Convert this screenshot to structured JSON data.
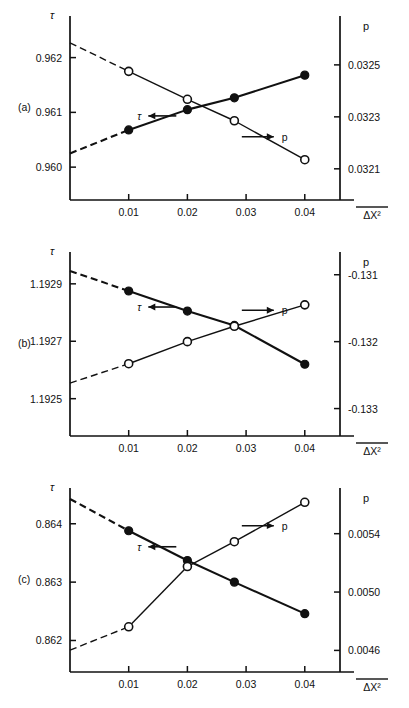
{
  "figure": {
    "xlabel": "ΔX²",
    "xlabel_overbar": true,
    "x_ticks": [
      "0.01",
      "0.02",
      "0.03",
      "0.04"
    ],
    "left_axis_title": "τ",
    "right_axis_title": "p",
    "tau_annotation": "τ",
    "p_annotation": "p",
    "tau_marker": "filled-circle",
    "p_marker": "open-circle"
  },
  "chart_data": [
    {
      "type": "line",
      "panel": "(a)",
      "title": "",
      "xlabel": "ΔX²",
      "x": [
        0.01,
        0.02,
        0.028,
        0.04
      ],
      "xlim": [
        0.0,
        0.046
      ],
      "xticks": [
        0.01,
        0.02,
        0.03,
        0.04
      ],
      "left_ylabel": "τ",
      "left_yticks": [
        0.96,
        0.961,
        0.962
      ],
      "left_yticklabels": [
        "0.960",
        "0.961",
        "0.962"
      ],
      "left_ylim": [
        0.9594,
        0.96265
      ],
      "right_ylabel": "p",
      "right_yticks": [
        0.0321,
        0.0323,
        0.0325
      ],
      "right_yticklabels": [
        "0.0321",
        "0.0323",
        "0.0325"
      ],
      "right_ylim": [
        0.03198,
        0.032665
      ],
      "series": [
        {
          "name": "τ",
          "axis": "left",
          "marker": "filled-circle",
          "values": [
            0.96068,
            0.96105,
            0.961265,
            0.96168
          ],
          "intercept_at_zero": 0.96025,
          "dashed_extrapolation": true
        },
        {
          "name": "p",
          "axis": "right",
          "marker": "open-circle",
          "values": [
            0.032475,
            0.0323675,
            0.032285,
            0.032135
          ],
          "intercept_at_zero": 0.032585,
          "dashed_extrapolation": true
        }
      ]
    },
    {
      "type": "line",
      "panel": "(b)",
      "title": "",
      "xlabel": "ΔX²",
      "x": [
        0.01,
        0.02,
        0.028,
        0.04
      ],
      "xlim": [
        0.0,
        0.046
      ],
      "xticks": [
        0.01,
        0.02,
        0.03,
        0.04
      ],
      "left_ylabel": "τ",
      "left_yticks": [
        1.1925,
        1.1927,
        1.1929
      ],
      "left_yticklabels": [
        "1.1925",
        "1.1927",
        "1.1929"
      ],
      "left_ylim": [
        1.19237,
        1.19299
      ],
      "right_ylabel": "p",
      "right_yticks": [
        -0.133,
        -0.132,
        -0.131
      ],
      "right_yticklabels": [
        "-0.133",
        "-0.132",
        "-0.131"
      ],
      "right_ylim": [
        -0.13341,
        -0.13075
      ],
      "series": [
        {
          "name": "τ",
          "axis": "left",
          "marker": "filled-circle",
          "values": [
            1.192875,
            1.192805,
            1.192755,
            1.19262
          ],
          "intercept_at_zero": 1.192945,
          "dashed_extrapolation": true
        },
        {
          "name": "p",
          "axis": "right",
          "marker": "open-circle",
          "values": [
            -0.13233,
            -0.132,
            -0.13177,
            -0.13145
          ],
          "intercept_at_zero": -0.13262,
          "dashed_extrapolation": true
        }
      ]
    },
    {
      "type": "line",
      "panel": "(c)",
      "title": "",
      "xlabel": "ΔX²",
      "x": [
        0.01,
        0.02,
        0.028,
        0.04
      ],
      "xlim": [
        0.0,
        0.046
      ],
      "xticks": [
        0.01,
        0.02,
        0.03,
        0.04
      ],
      "left_ylabel": "τ",
      "left_yticks": [
        0.862,
        0.863,
        0.864
      ],
      "left_yticklabels": [
        "0.862",
        "0.863",
        "0.864"
      ],
      "left_ylim": [
        0.86146,
        0.86451
      ],
      "right_ylabel": "p",
      "right_yticks": [
        0.0046,
        0.005,
        0.0054
      ],
      "right_yticklabels": [
        "0.0046",
        "0.0050",
        "0.0054"
      ],
      "right_ylim": [
        0.004452,
        0.005672
      ],
      "series": [
        {
          "name": "τ",
          "axis": "left",
          "marker": "filled-circle",
          "values": [
            0.86388,
            0.86337,
            0.863,
            0.86246
          ],
          "intercept_at_zero": 0.864425,
          "dashed_extrapolation": true
        },
        {
          "name": "p",
          "axis": "right",
          "marker": "open-circle",
          "values": [
            0.004762,
            0.005175,
            0.005345,
            0.005615
          ],
          "intercept_at_zero": 0.004602,
          "dashed_extrapolation": true
        }
      ]
    }
  ],
  "panels": [
    {
      "label": "(a)"
    },
    {
      "label": "(b)"
    },
    {
      "label": "(c)"
    }
  ]
}
